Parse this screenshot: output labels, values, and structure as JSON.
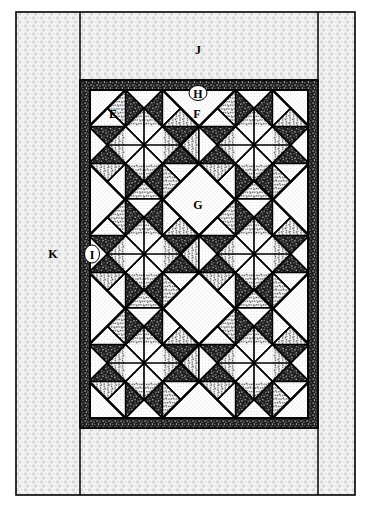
{
  "diagram": {
    "type": "quilt-construction-diagram",
    "canvas": {
      "width": 371,
      "height": 508
    },
    "colors": {
      "outline": "#000000",
      "background_fabric": "#f2f2f2",
      "light_fabric": "#ffffff",
      "medium_fabric": "#bdbdbd",
      "dark_fabric": "#1a1a1a",
      "page": "#ffffff"
    },
    "labels": [
      {
        "id": "E",
        "text": "E",
        "x": 113,
        "y": 118,
        "ellipse": false,
        "region": "block-corner-setting-triangle"
      },
      {
        "id": "F",
        "text": "F",
        "x": 196,
        "y": 118,
        "ellipse": false,
        "region": "setting-triangle-top"
      },
      {
        "id": "G",
        "text": "G",
        "x": 197,
        "y": 208,
        "ellipse": false,
        "region": "center-setting-square"
      },
      {
        "id": "H",
        "text": "H",
        "x": 198,
        "y": 93,
        "ellipse": true,
        "region": "inner-border-top"
      },
      {
        "id": "I",
        "text": "I",
        "x": 93,
        "y": 254,
        "ellipse": true,
        "region": "inner-border-side"
      },
      {
        "id": "K",
        "text": "K",
        "x": 53,
        "y": 254,
        "ellipse": false,
        "region": "outer-border-side"
      },
      {
        "id": "J",
        "text": "J",
        "x": 198,
        "y": 50,
        "ellipse": false,
        "region": "outer-border-top"
      }
    ],
    "frames": {
      "outer_rect": {
        "x": 16,
        "y": 12,
        "w": 339,
        "h": 483
      },
      "outer_border_v_left": 80,
      "outer_border_v_right": 318,
      "outer_border_h_top": 80,
      "outer_border_h_bottom": 428,
      "inner_border_rect": {
        "x": 80,
        "y": 80,
        "w": 238,
        "h": 348
      },
      "inner_border_width": 10,
      "quilt_field_rect": {
        "x": 90,
        "y": 90,
        "w": 218,
        "h": 328
      }
    },
    "grid": {
      "columns": 2,
      "rows": 3,
      "block_size": 104,
      "block_name": "on-point pinwheel block",
      "blocks_total": 6
    },
    "legend_keys": [
      "E",
      "F",
      "G",
      "H",
      "I",
      "J",
      "K"
    ]
  }
}
